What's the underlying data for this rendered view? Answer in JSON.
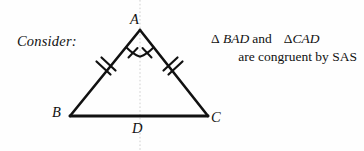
{
  "canvas": {
    "width": 364,
    "height": 151,
    "background": "#fefefe"
  },
  "prompt": {
    "label": "Consider:"
  },
  "statement": {
    "line1": {
      "delta_1": "Δ",
      "triangle_1": "BAD",
      "conjunction": "and",
      "delta_2": "Δ",
      "triangle_2": "CAD"
    },
    "line2": "are congruent by SAS"
  },
  "figure": {
    "type": "isosceles-triangle-diagram",
    "stroke_color": "#111111",
    "stroke_width": 2.6,
    "axis_color": "#cfcfcf",
    "vertices": [
      {
        "name": "A",
        "label": "A",
        "x": 140,
        "y": 30
      },
      {
        "name": "B",
        "label": "B",
        "x": 70,
        "y": 116
      },
      {
        "name": "C",
        "label": "C",
        "x": 208,
        "y": 116
      },
      {
        "name": "D",
        "label": "D",
        "x": 140,
        "y": 116
      }
    ],
    "segments": [
      {
        "name": "AB",
        "from": "A",
        "to": "B",
        "tick_marks": 2
      },
      {
        "name": "AC",
        "from": "A",
        "to": "C",
        "tick_marks": 2
      },
      {
        "name": "BC",
        "from": "B",
        "to": "C",
        "tick_marks": 0
      }
    ],
    "angle_marks": [
      {
        "name": "angle-BAD",
        "vertex": "A",
        "arcs": 1,
        "ticks": 1
      },
      {
        "name": "angle-CAD",
        "vertex": "A",
        "arcs": 1,
        "ticks": 1
      }
    ],
    "axis_of_symmetry": {
      "name": "vertical-symmetry-line",
      "x": 140,
      "y_top": 0,
      "y_bottom": 151,
      "style": "dotted"
    }
  }
}
